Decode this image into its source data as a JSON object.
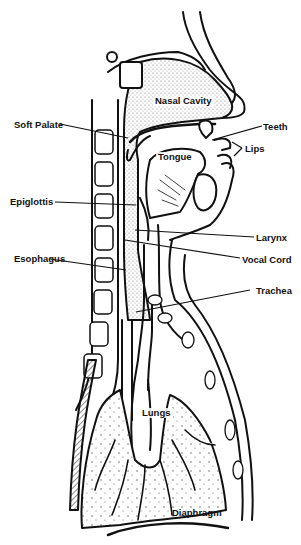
{
  "diagram": {
    "labels": {
      "nasal_cavity": "Nasal Cavity",
      "soft_palate": "Soft Palate",
      "teeth": "Teeth",
      "lips": "Lips",
      "tongue": "Tongue",
      "epiglottis": "Epiglottis",
      "larynx": "Larynx",
      "esophagus": "Esophagus",
      "vocal_cord": "Vocal Cord",
      "trachea": "Trachea",
      "lungs": "Lungs",
      "diaphragm": "Diaphragm"
    },
    "colors": {
      "ink": "#111111",
      "stipple": "#bdbdbd",
      "background": "#ffffff"
    }
  }
}
